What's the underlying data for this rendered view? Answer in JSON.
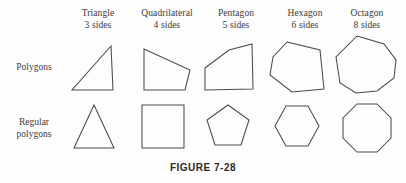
{
  "figure": {
    "caption": "FIGURE 7-28",
    "stroke_color": "#4a4a4a",
    "background_color": "#fdfdfd",
    "text_color": "#3a3a3a"
  },
  "columns": [
    {
      "name": "Triangle",
      "sides": "3 sides"
    },
    {
      "name": "Quadrilateral",
      "sides": "4 sides"
    },
    {
      "name": "Pentagon",
      "sides": "5 sides"
    },
    {
      "name": "Hexagon",
      "sides": "6 sides"
    },
    {
      "name": "Octagon",
      "sides": "8 sides"
    }
  ],
  "rows": [
    {
      "line1": "Polygons",
      "line2": ""
    },
    {
      "line1": "Regular",
      "line2": "polygons"
    }
  ],
  "shapes": {
    "irregular": {
      "triangle": "111,46 72,90 113,90",
      "quadrilateral": "144,49 190,70 185,90 144,90",
      "pentagon": "205,68 229,50 252,44 253,89 205,90",
      "hexagon": "287,42 320,50 324,89 292,92 270,75 273,57",
      "octagon": "357,36 384,44 396,60 394,78 377,91 356,93 340,83 336,57"
    },
    "regular": {
      "triangle": "94,105 114,148 74,148",
      "square": {
        "x": 142,
        "y": 105,
        "w": 42,
        "h": 43
      },
      "pentagon": "228,105 249,120 241,145 215,145 207,120",
      "hexagon": "286,106 308,106 319,126 308,146 286,146 275,126",
      "octagon": "357,104 377,104 391,118 391,138 377,152 357,152 343,138 343,118"
    }
  }
}
